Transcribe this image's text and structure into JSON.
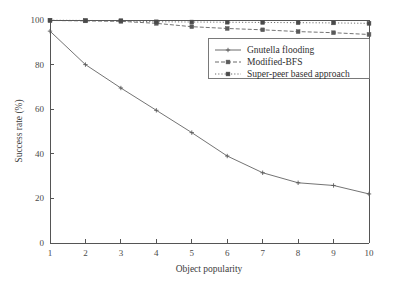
{
  "chart_data": {
    "type": "line",
    "title": "",
    "xlabel": "Object popularity",
    "ylabel": "Success rate (%)",
    "xlim": [
      1,
      10
    ],
    "ylim": [
      0,
      100
    ],
    "xticks": [
      "1",
      "2",
      "3",
      "4",
      "5",
      "6",
      "7",
      "8",
      "9",
      "10"
    ],
    "yticks": [
      "0",
      "20",
      "40",
      "60",
      "80",
      "100"
    ],
    "grid": false,
    "legend_position": "upper-right-inside",
    "x": [
      1,
      2,
      3,
      4,
      5,
      6,
      7,
      8,
      9,
      10
    ],
    "series": [
      {
        "name": "Gnutella flooding",
        "line_style": "solid",
        "marker": "plus",
        "color": "#5a5a5a",
        "values": [
          95,
          80,
          69.5,
          59.5,
          49.5,
          39,
          31.5,
          27,
          25.8,
          22
        ]
      },
      {
        "name": "Modified-BFS",
        "line_style": "dashed",
        "marker": "square",
        "color": "#5a5a5a",
        "values": [
          99.8,
          99.6,
          99.4,
          98.5,
          97,
          96.2,
          95.6,
          94.8,
          94.3,
          93.5
        ]
      },
      {
        "name": "Super-peer based approach",
        "line_style": "dotted",
        "marker": "square",
        "color": "#4a4a4a",
        "values": [
          99.9,
          99.8,
          99.7,
          99.2,
          99.1,
          99,
          98.9,
          98.8,
          98.7,
          98.5
        ]
      }
    ]
  },
  "axes": {
    "x_title": "Object popularity",
    "y_title": "Success rate (%)"
  },
  "legend": {
    "entries": [
      {
        "label": "Gnutella flooding"
      },
      {
        "label": "Modified-BFS"
      },
      {
        "label": "Super-peer based approach"
      }
    ]
  },
  "ticks": {
    "x": [
      "1",
      "2",
      "3",
      "4",
      "5",
      "6",
      "7",
      "8",
      "9",
      "10"
    ],
    "y": [
      "0",
      "20",
      "40",
      "60",
      "80",
      "100"
    ]
  }
}
